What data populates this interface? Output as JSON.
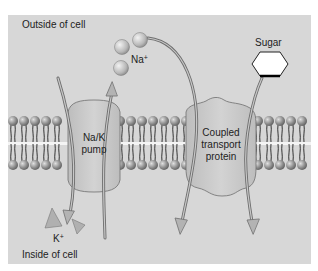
{
  "diagram": {
    "type": "membrane-transport",
    "labels": {
      "outside": "Outside of cell",
      "inside": "Inside of cell",
      "na_ion": "Na",
      "na_charge": "+",
      "k_ion": "K",
      "k_charge": "+",
      "sugar": "Sugar",
      "pump_line1": "Na/K",
      "pump_line2": "pump",
      "coupled_line1": "Coupled",
      "coupled_line2": "transport",
      "coupled_line3": "protein"
    },
    "colors": {
      "background_panel": "#d7d7d7",
      "lipid_head": "#8a8a8a",
      "protein_fill": "#c9c9c9",
      "arrow": "#7a7a7a",
      "ion_fill": "#bdbdbd",
      "sugar_fill": "#ffffff"
    },
    "nodes": [
      {
        "id": "na_k_pump",
        "label": "Na/K pump"
      },
      {
        "id": "coupled_transport_protein",
        "label": "Coupled transport protein"
      },
      {
        "id": "na_ions",
        "label": "Na+",
        "count": 3
      },
      {
        "id": "k_ions",
        "label": "K+",
        "count": 2
      },
      {
        "id": "sugar",
        "label": "Sugar"
      }
    ],
    "edges": [
      {
        "from": "inside",
        "to": "outside",
        "via": "na_k_pump",
        "carries": "Na+"
      },
      {
        "from": "outside",
        "to": "inside",
        "via": "na_k_pump",
        "carries": "K+"
      },
      {
        "from": "outside",
        "to": "inside",
        "via": "coupled_transport_protein",
        "carries": "Na+"
      },
      {
        "from": "outside",
        "to": "inside",
        "via": "coupled_transport_protein",
        "carries": "Sugar"
      }
    ]
  }
}
